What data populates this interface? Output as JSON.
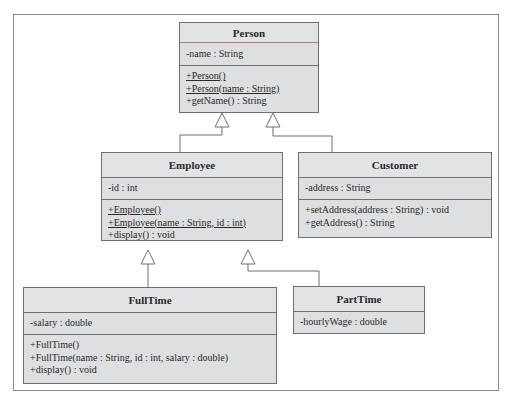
{
  "diagram": {
    "type": "UML class diagram",
    "classes": {
      "person": {
        "name": "Person",
        "attributes": [
          "-name : String"
        ],
        "operations": [
          {
            "text": "+Person()",
            "static": true
          },
          {
            "text": "+Person(name : String)",
            "static": true
          },
          {
            "text": "+getName() : String",
            "static": false
          }
        ]
      },
      "employee": {
        "name": "Employee",
        "attributes": [
          "-id : int"
        ],
        "operations": [
          {
            "text": "+Employee()",
            "static": true
          },
          {
            "text": "+Employee(name : String, id : int)",
            "static": true
          },
          {
            "text": "+display() : void",
            "static": false
          }
        ]
      },
      "customer": {
        "name": "Customer",
        "attributes": [
          "-address : String"
        ],
        "operations": [
          {
            "text": "+setAddress(address : String) : void",
            "static": false
          },
          {
            "text": "+getAddress() : String",
            "static": false
          }
        ]
      },
      "fulltime": {
        "name": "FullTime",
        "attributes": [
          "-salary : double"
        ],
        "operations": [
          {
            "text": "+FullTime()",
            "static": false
          },
          {
            "text": "+FullTime(name : String, id : int, salary : double)",
            "static": false
          },
          {
            "text": "+display() : void",
            "static": false
          }
        ]
      },
      "parttime": {
        "name": "PartTime",
        "attributes": [
          "-hourlyWage : double"
        ],
        "operations": []
      }
    },
    "relationships": [
      {
        "type": "generalization",
        "from": "Employee",
        "to": "Person"
      },
      {
        "type": "generalization",
        "from": "Customer",
        "to": "Person"
      },
      {
        "type": "generalization",
        "from": "FullTime",
        "to": "Employee"
      },
      {
        "type": "generalization",
        "from": "PartTime",
        "to": "Employee"
      }
    ],
    "colors": {
      "box_fill": "#dedfe1",
      "box_border": "#6f6f6f",
      "line": "#6f6f6f",
      "frame": "#8a8a8a"
    }
  }
}
